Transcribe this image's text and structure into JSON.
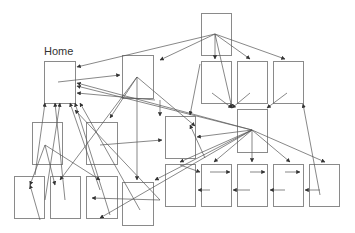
{
  "diagram": {
    "home_label": "Home",
    "colors": {
      "node_stroke": "#8a8a8a",
      "edge": "#555555",
      "background": "#ffffff"
    },
    "nodes": [
      {
        "id": "home",
        "x": 44,
        "y": 61,
        "w": 31,
        "h": 42,
        "label": "Home"
      },
      {
        "id": "n2",
        "x": 122,
        "y": 55,
        "w": 31,
        "h": 43
      },
      {
        "id": "top",
        "x": 201,
        "y": 13,
        "w": 30,
        "h": 42
      },
      {
        "id": "r2a",
        "x": 201,
        "y": 61,
        "w": 30,
        "h": 42
      },
      {
        "id": "r2b",
        "x": 237,
        "y": 61,
        "w": 30,
        "h": 42
      },
      {
        "id": "r2c",
        "x": 273,
        "y": 61,
        "w": 30,
        "h": 42
      },
      {
        "id": "mid",
        "x": 165,
        "y": 116,
        "w": 30,
        "h": 42
      },
      {
        "id": "rmid",
        "x": 237,
        "y": 109,
        "w": 30,
        "h": 43
      },
      {
        "id": "l1",
        "x": 32,
        "y": 122,
        "w": 30,
        "h": 42
      },
      {
        "id": "l2",
        "x": 86,
        "y": 122,
        "w": 31,
        "h": 42
      },
      {
        "id": "b1",
        "x": 14,
        "y": 176,
        "w": 30,
        "h": 42
      },
      {
        "id": "b2",
        "x": 50,
        "y": 176,
        "w": 30,
        "h": 42
      },
      {
        "id": "b3",
        "x": 86,
        "y": 176,
        "w": 31,
        "h": 42
      },
      {
        "id": "b4",
        "x": 122,
        "y": 182,
        "w": 31,
        "h": 43
      },
      {
        "id": "c1",
        "x": 165,
        "y": 164,
        "w": 30,
        "h": 42
      },
      {
        "id": "c2",
        "x": 201,
        "y": 164,
        "w": 30,
        "h": 42
      },
      {
        "id": "c3",
        "x": 237,
        "y": 164,
        "w": 30,
        "h": 42
      },
      {
        "id": "c4",
        "x": 273,
        "y": 164,
        "w": 30,
        "h": 42
      },
      {
        "id": "c5",
        "x": 309,
        "y": 164,
        "w": 30,
        "h": 42
      }
    ],
    "edges": [
      [
        58,
        82,
        120,
        75
      ],
      [
        215,
        34,
        77,
        67
      ],
      [
        215,
        34,
        160,
        60
      ],
      [
        215,
        34,
        215,
        59
      ],
      [
        215,
        34,
        250,
        59
      ],
      [
        215,
        34,
        285,
        59
      ],
      [
        215,
        34,
        232,
        108
      ],
      [
        252,
        130,
        77,
        83
      ],
      [
        252,
        130,
        77,
        86
      ],
      [
        252,
        130,
        197,
        137
      ],
      [
        252,
        130,
        180,
        162
      ],
      [
        252,
        130,
        252,
        162
      ],
      [
        252,
        130,
        214,
        162
      ],
      [
        252,
        130,
        290,
        162
      ],
      [
        252,
        130,
        325,
        162
      ],
      [
        252,
        130,
        155,
        180
      ],
      [
        252,
        130,
        100,
        218
      ],
      [
        137,
        77,
        137,
        180
      ],
      [
        137,
        77,
        195,
        126
      ],
      [
        137,
        77,
        110,
        118
      ],
      [
        137,
        77,
        60,
        180
      ],
      [
        212,
        93,
        232,
        108
      ],
      [
        250,
        93,
        232,
        108
      ],
      [
        287,
        93,
        267,
        108
      ],
      [
        155,
        100,
        77,
        93
      ],
      [
        160,
        100,
        160,
        116
      ],
      [
        110,
        215,
        75,
        103
      ],
      [
        100,
        190,
        70,
        103
      ],
      [
        140,
        210,
        80,
        103
      ],
      [
        45,
        200,
        60,
        103
      ],
      [
        65,
        200,
        55,
        103
      ],
      [
        45,
        145,
        30,
        185
      ],
      [
        45,
        145,
        55,
        185
      ],
      [
        45,
        145,
        100,
        180
      ],
      [
        35,
        175,
        45,
        103
      ],
      [
        160,
        200,
        92,
        198
      ],
      [
        160,
        200,
        75,
        110
      ],
      [
        100,
        145,
        162,
        140
      ],
      [
        205,
        158,
        190,
        125
      ],
      [
        180,
        165,
        200,
        172
      ],
      [
        210,
        172,
        230,
        172
      ],
      [
        250,
        172,
        265,
        172
      ],
      [
        285,
        172,
        300,
        172
      ],
      [
        210,
        190,
        198,
        190
      ],
      [
        250,
        190,
        233,
        190
      ],
      [
        285,
        190,
        270,
        190
      ],
      [
        320,
        190,
        305,
        190
      ],
      [
        320,
        195,
        303,
        104
      ],
      [
        200,
        64,
        190,
        115
      ],
      [
        40,
        220,
        30,
        185
      ]
    ]
  }
}
